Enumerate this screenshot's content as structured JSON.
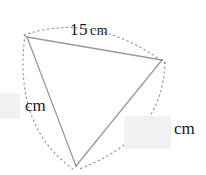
{
  "figure": {
    "type": "triangle-with-arcs",
    "stroke_color": "#9a9a9a",
    "arc_color": "#8d8d8d",
    "background": "#ffffff",
    "box_fill": "#f1f1f1",
    "text_color": "#1a1a1a",
    "vertices": {
      "top_left": {
        "x": 27,
        "y": 37
      },
      "right": {
        "x": 162,
        "y": 60
      },
      "bottom": {
        "x": 76,
        "y": 166
      }
    },
    "arcs": [
      {
        "name": "arc-top",
        "from": "top_left",
        "to": "right",
        "bulge": "outward"
      },
      {
        "name": "arc-right",
        "from": "right",
        "to": "bottom",
        "bulge": "outward"
      },
      {
        "name": "arc-left",
        "from": "top_left",
        "to": "bottom",
        "bulge": "outward"
      }
    ]
  },
  "labels": {
    "top_side": {
      "value": "15",
      "unit": "cm",
      "full": "15 cm"
    },
    "left_side": {
      "value": "",
      "unit": "cm"
    },
    "right_side": {
      "value": "",
      "unit": "cm"
    }
  }
}
